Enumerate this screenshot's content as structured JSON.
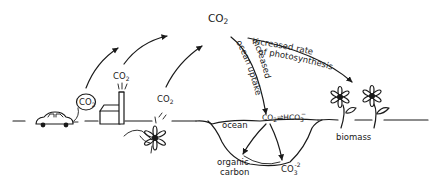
{
  "diagram": {
    "atmosphere": {
      "label_main": "CO",
      "label_sub": "2"
    },
    "sources": {
      "car": {
        "label_main": "CO",
        "label_sub": "2"
      },
      "factory": {
        "label_main": "CO",
        "label_sub": "2"
      },
      "decay": {
        "label_main": "CO",
        "label_sub": "2"
      }
    },
    "pathways": {
      "ocean_uptake_line1": "increased",
      "ocean_uptake_line2": "ocean uptake",
      "photosynthesis_line1": "increased rate",
      "photosynthesis_line2": "of photosynthesis"
    },
    "ocean": {
      "label": "ocean",
      "equilibrium_left_main": "CO",
      "equilibrium_left_sub": "2",
      "equilibrium_arrow": "⇌",
      "equilibrium_right_main": "HCO",
      "equilibrium_right_sub": "3",
      "equilibrium_right_sup": "−",
      "organic_carbon_line1": "organic",
      "organic_carbon_line2": "carbon",
      "carbonate_main": "CO",
      "carbonate_sub": "3",
      "carbonate_sup": "-2"
    },
    "land": {
      "biomass_label": "biomass"
    },
    "colors": {
      "ink": "#1a1a1a",
      "background": "#ffffff"
    }
  }
}
